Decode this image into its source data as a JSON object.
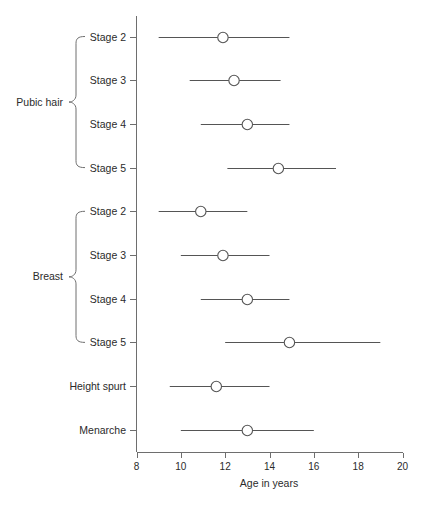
{
  "chart_data": {
    "type": "scatter",
    "title": "",
    "subtitle": "",
    "xlabel": "Age in years",
    "ylabel": "",
    "xlim": [
      8,
      20
    ],
    "xticks": [
      8,
      10,
      12,
      14,
      16,
      18,
      20
    ],
    "xticklabels": [
      "8",
      "10",
      "12",
      "14",
      "16",
      "18",
      "20"
    ],
    "grid": false,
    "legend": null,
    "orientation": "horizontal",
    "marker": "open-circle",
    "groups": [
      {
        "name": "Pubic hair",
        "label": "Pubic hair",
        "rows": [
          0,
          1,
          2,
          3
        ]
      },
      {
        "name": "Breast",
        "label": "Breast",
        "rows": [
          4,
          5,
          6,
          7
        ]
      }
    ],
    "categories": [
      "Stage 2",
      "Stage 3",
      "Stage 4",
      "Stage 5",
      "Stage 2",
      "Stage 3",
      "Stage 4",
      "Stage 5",
      "Height spurt",
      "Menarche"
    ],
    "points": [
      {
        "label": "Stage 2",
        "group": "Pubic hair",
        "mean": 11.9,
        "low": 9.0,
        "high": 14.9
      },
      {
        "label": "Stage 3",
        "group": "Pubic hair",
        "mean": 12.4,
        "low": 10.4,
        "high": 14.5
      },
      {
        "label": "Stage 4",
        "group": "Pubic hair",
        "mean": 13.0,
        "low": 10.9,
        "high": 14.9
      },
      {
        "label": "Stage 5",
        "group": "Pubic hair",
        "mean": 14.4,
        "low": 12.1,
        "high": 17.0
      },
      {
        "label": "Stage 2",
        "group": "Breast",
        "mean": 10.9,
        "low": 9.0,
        "high": 13.0
      },
      {
        "label": "Stage 3",
        "group": "Breast",
        "mean": 11.9,
        "low": 10.0,
        "high": 14.0
      },
      {
        "label": "Stage 4",
        "group": "Breast",
        "mean": 13.0,
        "low": 10.9,
        "high": 14.9
      },
      {
        "label": "Stage 5",
        "group": "Breast",
        "mean": 14.9,
        "low": 12.0,
        "high": 19.0
      },
      {
        "label": "Height spurt",
        "group": "",
        "mean": 11.6,
        "low": 9.5,
        "high": 14.0
      },
      {
        "label": "Menarche",
        "group": "",
        "mean": 13.0,
        "low": 10.0,
        "high": 16.0
      }
    ]
  },
  "axis": {
    "x_title": "Age in years",
    "tick_labels": [
      "8",
      "10",
      "12",
      "14",
      "16",
      "18",
      "20"
    ]
  },
  "labels": {
    "rows": [
      "Stage 2",
      "Stage 3",
      "Stage 4",
      "Stage 5",
      "Stage 2",
      "Stage 3",
      "Stage 4",
      "Stage 5",
      "Height spurt",
      "Menarche"
    ],
    "groups": [
      "Pubic hair",
      "Breast"
    ]
  },
  "colors": {
    "background": "#ffffff",
    "axis": "#6e6e6e",
    "line": "#555555",
    "marker_fill": "#ffffff",
    "text": "#2b2b2b"
  }
}
